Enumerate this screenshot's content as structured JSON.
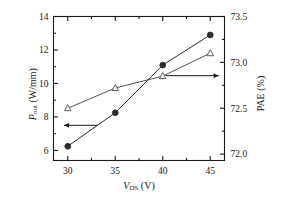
{
  "chart_data": {
    "type": "line",
    "title": "",
    "xlabel": "V_DS (V)",
    "ylabel": "P_out (W/mm)",
    "y2label": "PAE (%)",
    "x": [
      30,
      35,
      40,
      45
    ],
    "xlim": [
      28.5,
      46.5
    ],
    "ylim": [
      5.4,
      14.0
    ],
    "y2lim": [
      71.93,
      73.5
    ],
    "grid": false,
    "legend": "none",
    "series": [
      {
        "name": "P_out",
        "axis": "left",
        "marker": "filled-circle",
        "values": [
          6.25,
          8.25,
          11.1,
          12.9
        ]
      },
      {
        "name": "PAE",
        "axis": "right",
        "marker": "open-triangle",
        "values": [
          72.5,
          72.72,
          72.85,
          73.1
        ]
      }
    ],
    "annotations": [
      {
        "name": "left-arrow",
        "points_to": "left-axis",
        "x_start": 33.1,
        "x_end": 29.6,
        "y_left": 7.5
      },
      {
        "name": "right-arrow",
        "points_to": "right-axis",
        "x_start": 40.3,
        "x_end": 45.9,
        "y_right": 72.855
      }
    ],
    "xticks": [
      "30",
      "35",
      "40",
      "45"
    ],
    "yticks": [
      "6",
      "8",
      "10",
      "12",
      "14"
    ],
    "y2ticks": [
      "72.0",
      "72.5",
      "73.0",
      "73.5"
    ],
    "x_minor_count": 1,
    "y_minor_count": 1,
    "y2_minor_count": 1
  },
  "labels": {
    "x_axis_symbol": "V",
    "x_axis_subscript": "DS",
    "x_axis_unit": "(V)",
    "y_axis_symbol": "P",
    "y_axis_subscript": "out",
    "y_axis_unit": "(W/mm)",
    "y2_axis_symbol": "PAE",
    "y2_axis_unit": "(%)"
  },
  "colors": {
    "axis": "#1a1a1a",
    "series_pout": "#2a2a2a",
    "series_pae": "#555555",
    "background": "#ffffff"
  }
}
